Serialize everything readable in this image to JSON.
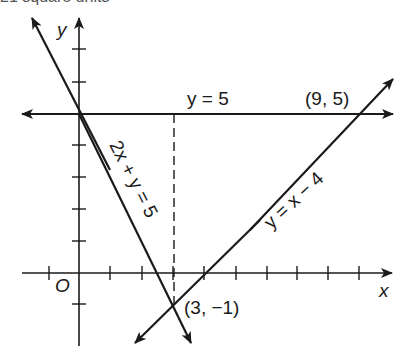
{
  "header_fragment": "21 square units",
  "axes": {
    "x_label": "x",
    "y_label": "y",
    "origin_label": "O",
    "x_ticks": [
      -1,
      1,
      2,
      3,
      4,
      5,
      6,
      7,
      8,
      9
    ],
    "y_ticks": [
      -1,
      1,
      2,
      3,
      4,
      5,
      6,
      7
    ]
  },
  "lines": [
    {
      "name": "horizontal",
      "equation": "y = 5",
      "label": "y = 5"
    },
    {
      "name": "descending",
      "equation": "2x + y = 5",
      "label": "2x + y = 5"
    },
    {
      "name": "ascending",
      "equation": "y = x − 4",
      "label": "y = x − 4"
    }
  ],
  "points": [
    {
      "label": "(9, 5)",
      "x": 9,
      "y": 5
    },
    {
      "label": "(3, −1)",
      "x": 3,
      "y": -1
    },
    {
      "label": "(0, 5)",
      "x": 0,
      "y": 5,
      "shown_label": false
    }
  ],
  "dashed_segment": {
    "from": [
      3,
      5
    ],
    "to": [
      3,
      -1
    ]
  },
  "colors": {
    "ink": "#1a1a1a",
    "background": "#ffffff"
  }
}
